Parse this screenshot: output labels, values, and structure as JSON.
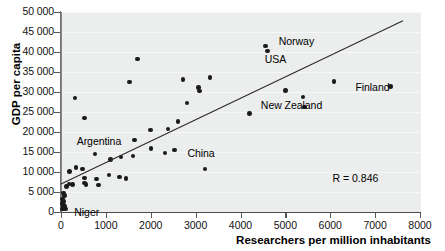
{
  "chart_data": {
    "type": "scatter",
    "title": "",
    "xlabel": "Researchers per million inhabitants",
    "ylabel": "GDP per capita",
    "xlim": [
      0,
      8000
    ],
    "ylim": [
      0,
      50000
    ],
    "xticks": [
      0,
      1000,
      2000,
      3000,
      4000,
      5000,
      6000,
      7000,
      8000
    ],
    "xticklabels": [
      "0",
      "1000",
      "2000",
      "3000",
      "4000",
      "5000",
      "6000",
      "7000",
      "8000"
    ],
    "yticks": [
      0,
      5000,
      10000,
      15000,
      20000,
      25000,
      30000,
      35000,
      40000,
      45000,
      50000
    ],
    "yticklabels": [
      "0",
      "5 000",
      "10 000",
      "15 000",
      "20 000",
      "25 000",
      "30 000",
      "35 000",
      "40 000",
      "45 000",
      "50 000"
    ],
    "grid": true,
    "legend": null,
    "annotations": [
      {
        "text": "R = 0.846",
        "x": 6050,
        "y": 8200
      }
    ],
    "trendline": {
      "type": "linear",
      "x0": 0,
      "y0": 7000,
      "x1": 7620,
      "y1": 47800,
      "slope": 5.354,
      "intercept": 7000,
      "R": 0.846
    },
    "point_color": "#1a1a1a",
    "panel_color": "#eceded",
    "points": [
      {
        "x": 30,
        "y": 700,
        "label": ""
      },
      {
        "x": 45,
        "y": 1100,
        "label": ""
      },
      {
        "x": 55,
        "y": 1600,
        "label": ""
      },
      {
        "x": 40,
        "y": 2100,
        "label": ""
      },
      {
        "x": 70,
        "y": 900,
        "label": ""
      },
      {
        "x": 90,
        "y": 1400,
        "label": ""
      },
      {
        "x": 60,
        "y": 2600,
        "label": ""
      },
      {
        "x": 35,
        "y": 3300,
        "label": ""
      },
      {
        "x": 75,
        "y": 4100,
        "label": ""
      },
      {
        "x": 55,
        "y": 4700,
        "label": ""
      },
      {
        "x": 110,
        "y": 700,
        "label": "Niger"
      },
      {
        "x": 120,
        "y": 6400,
        "label": ""
      },
      {
        "x": 175,
        "y": 7000,
        "label": ""
      },
      {
        "x": 190,
        "y": 10100,
        "label": ""
      },
      {
        "x": 260,
        "y": 6900,
        "label": ""
      },
      {
        "x": 330,
        "y": 11100,
        "label": ""
      },
      {
        "x": 480,
        "y": 10700,
        "label": ""
      },
      {
        "x": 520,
        "y": 8500,
        "label": ""
      },
      {
        "x": 530,
        "y": 7300,
        "label": ""
      },
      {
        "x": 560,
        "y": 6900,
        "label": ""
      },
      {
        "x": 790,
        "y": 8200,
        "label": ""
      },
      {
        "x": 830,
        "y": 6800,
        "label": ""
      },
      {
        "x": 760,
        "y": 14500,
        "label": ""
      },
      {
        "x": 520,
        "y": 23500,
        "label": ""
      },
      {
        "x": 310,
        "y": 28500,
        "label": ""
      },
      {
        "x": 1070,
        "y": 9200,
        "label": ""
      },
      {
        "x": 1100,
        "y": 13100,
        "label": ""
      },
      {
        "x": 1300,
        "y": 8800,
        "label": ""
      },
      {
        "x": 1340,
        "y": 13700,
        "label": ""
      },
      {
        "x": 1450,
        "y": 8400,
        "label": ""
      },
      {
        "x": 1600,
        "y": 14000,
        "label": ""
      },
      {
        "x": 1640,
        "y": 18000,
        "label": ""
      },
      {
        "x": 1530,
        "y": 32500,
        "label": ""
      },
      {
        "x": 1700,
        "y": 38300,
        "label": ""
      },
      {
        "x": 2000,
        "y": 20500,
        "label": ""
      },
      {
        "x": 2010,
        "y": 15900,
        "label": ""
      },
      {
        "x": 2320,
        "y": 14700,
        "label": ""
      },
      {
        "x": 2380,
        "y": 20700,
        "label": ""
      },
      {
        "x": 2530,
        "y": 15500,
        "label": "China"
      },
      {
        "x": 2610,
        "y": 22600,
        "label": ""
      },
      {
        "x": 2720,
        "y": 33100,
        "label": ""
      },
      {
        "x": 2810,
        "y": 27300,
        "label": ""
      },
      {
        "x": 3060,
        "y": 31100,
        "label": ""
      },
      {
        "x": 3080,
        "y": 30300,
        "label": ""
      },
      {
        "x": 3210,
        "y": 10800,
        "label": ""
      },
      {
        "x": 3320,
        "y": 33600,
        "label": ""
      },
      {
        "x": 4200,
        "y": 24600,
        "label": "New Zealand"
      },
      {
        "x": 4560,
        "y": 41500,
        "label": "Norway"
      },
      {
        "x": 4600,
        "y": 40300,
        "label": "USA"
      },
      {
        "x": 5000,
        "y": 30400,
        "label": ""
      },
      {
        "x": 5390,
        "y": 28700,
        "label": ""
      },
      {
        "x": 5420,
        "y": 26200,
        "label": ""
      },
      {
        "x": 6080,
        "y": 32600,
        "label": ""
      },
      {
        "x": 7340,
        "y": 31400,
        "label": "Finland"
      }
    ],
    "labels": [
      {
        "text": "Niger",
        "x": 118,
        "y": 700,
        "anchor": "left",
        "dx": 8,
        "dy": 4
      },
      {
        "text": "Argentina",
        "x": 350,
        "y": 17600,
        "anchor": "left",
        "dx": 0,
        "dy": 0
      },
      {
        "text": "China",
        "x": 2640,
        "y": 15300,
        "anchor": "left",
        "dx": 8,
        "dy": 3
      },
      {
        "text": "New Zealand",
        "x": 4320,
        "y": 26600,
        "anchor": "left",
        "dx": 6,
        "dy": 0
      },
      {
        "text": "Norway",
        "x": 4720,
        "y": 42500,
        "anchor": "left",
        "dx": 6,
        "dy": 0
      },
      {
        "text": "USA",
        "x": 4540,
        "y": 38100,
        "anchor": "left",
        "dx": 0,
        "dy": 0
      },
      {
        "text": "Finland",
        "x": 6560,
        "y": 31000,
        "anchor": "left",
        "dx": 0,
        "dy": 0
      }
    ]
  }
}
